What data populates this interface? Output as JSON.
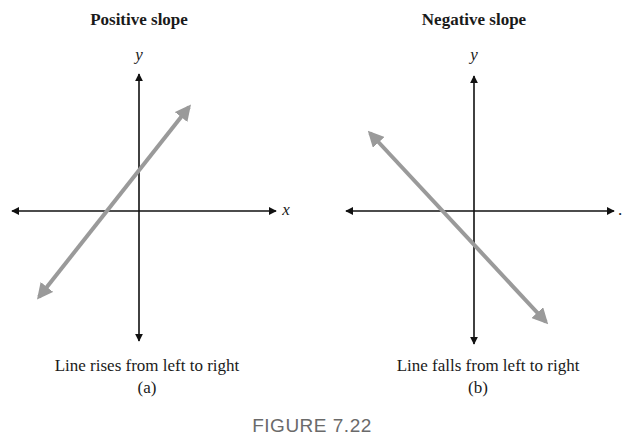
{
  "figure": {
    "label": "FIGURE 7.22",
    "colors": {
      "axis": "#111111",
      "line": "#9a9a9a",
      "text": "#1a1a1a",
      "figure_label": "#6a6a6a"
    },
    "panels": [
      {
        "id": "a",
        "title": "Positive slope",
        "y_axis_label": "y",
        "x_axis_label": "x",
        "caption": "Line rises from left to right",
        "sublabel": "(a)",
        "line_direction": "rising"
      },
      {
        "id": "b",
        "title": "Negative slope",
        "y_axis_label": "y",
        "x_axis_label": ".",
        "caption": "Line falls from left to right",
        "sublabel": "(b)",
        "line_direction": "falling"
      }
    ]
  }
}
